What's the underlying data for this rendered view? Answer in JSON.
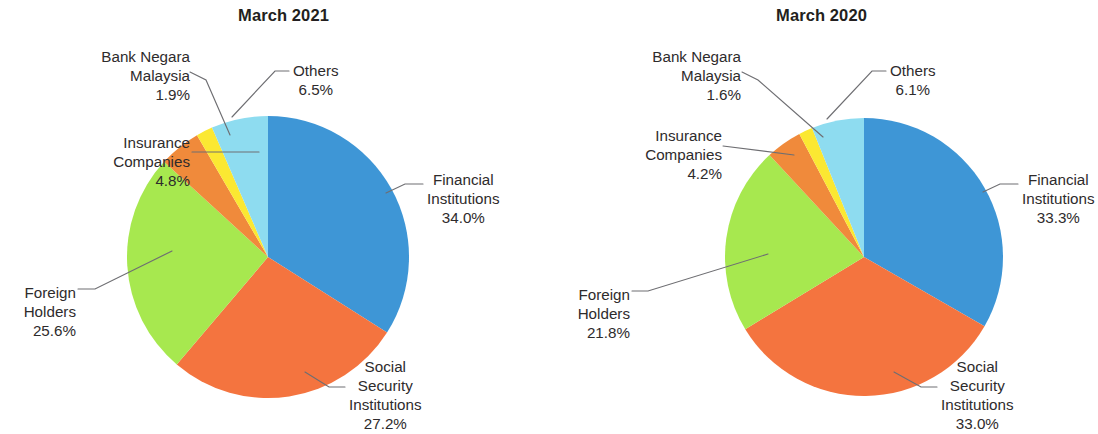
{
  "chart_data": [
    {
      "type": "pie",
      "title": "March 2021",
      "categories": [
        "Financial Institutions",
        "Social Security Institutions",
        "Foreign Holders",
        "Insurance Companies",
        "Bank Negara Malaysia",
        "Others"
      ],
      "values": [
        34.0,
        27.2,
        25.6,
        4.8,
        1.9,
        6.5
      ],
      "value_labels": [
        "34.0%",
        "27.2%",
        "25.6%",
        "4.8%",
        "1.9%",
        "6.5%"
      ],
      "colors": [
        "#3e96d6",
        "#f4743f",
        "#a7e84f",
        "#f08a3b",
        "#fbe832",
        "#8edcf0"
      ],
      "start_angle_deg": 0,
      "direction": "clockwise",
      "legend": "none",
      "labels_position": "outside-with-leader-lines",
      "units": "percent"
    },
    {
      "type": "pie",
      "title": "March 2020",
      "categories": [
        "Financial Institutions",
        "Social Security Institutions",
        "Foreign Holders",
        "Insurance Companies",
        "Bank Negara Malaysia",
        "Others"
      ],
      "values": [
        33.3,
        33.0,
        21.8,
        4.2,
        1.6,
        6.1
      ],
      "value_labels": [
        "33.3%",
        "33.0%",
        "21.8%",
        "4.2%",
        "1.6%",
        "6.1%"
      ],
      "colors": [
        "#3e96d6",
        "#f4743f",
        "#a7e84f",
        "#f08a3b",
        "#fbe832",
        "#8edcf0"
      ],
      "start_angle_deg": 0,
      "direction": "clockwise",
      "legend": "none",
      "labels_position": "outside-with-leader-lines",
      "units": "percent"
    }
  ],
  "left": {
    "title": "March 2021",
    "labels": {
      "bnm": {
        "l1": "Bank Negara",
        "l2": "Malaysia",
        "pct": "1.9%"
      },
      "insurance": {
        "l1": "Insurance",
        "l2": "Companies",
        "pct": "4.8%"
      },
      "foreign": {
        "l1": "Foreign",
        "l2": "Holders",
        "pct": "25.6%"
      },
      "others": {
        "l1": "Others",
        "pct": "6.5%"
      },
      "financial": {
        "l1": "Financial",
        "l2": "Institutions",
        "pct": "34.0%"
      },
      "social": {
        "l1": "Social",
        "l2": "Security",
        "l3": "Institutions",
        "pct": "27.2%"
      }
    }
  },
  "right": {
    "title": "March 2020",
    "labels": {
      "bnm": {
        "l1": "Bank Negara",
        "l2": "Malaysia",
        "pct": "1.6%"
      },
      "insurance": {
        "l1": "Insurance",
        "l2": "Companies",
        "pct": "4.2%"
      },
      "foreign": {
        "l1": "Foreign",
        "l2": "Holders",
        "pct": "21.8%"
      },
      "others": {
        "l1": "Others",
        "pct": "6.1%"
      },
      "financial": {
        "l1": "Financial",
        "l2": "Institutions",
        "pct": "33.3%"
      },
      "social": {
        "l1": "Social",
        "l2": "Security",
        "l3": "Institutions",
        "pct": "33.0%"
      }
    }
  },
  "colors": {
    "financial": "#3e96d6",
    "social": "#f4743f",
    "foreign": "#a7e84f",
    "insurance": "#f08a3b",
    "bnm": "#fbe832",
    "others": "#8edcf0",
    "leader_line": "#6e6e72",
    "text": "#2e2b2c"
  }
}
